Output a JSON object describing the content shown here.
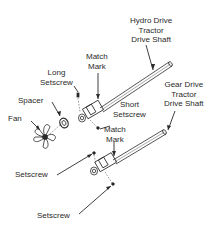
{
  "diagram": {
    "type": "exploded-parts-assembly",
    "labels": {
      "hydro_shaft": [
        "Hydro Drive",
        "Tractor",
        "Drive Shaft"
      ],
      "match_mark_top": [
        "Match",
        "Mark"
      ],
      "long_setscrew": [
        "Long",
        "Setscrew"
      ],
      "spacer": "Spacer",
      "fan": "Fan",
      "short_setscrew": [
        "Short",
        "Setscrew"
      ],
      "gear_shaft": [
        "Gear Drive",
        "Tractor",
        "Drive Shaft"
      ],
      "match_mark_bottom": [
        "Match",
        "Mark"
      ],
      "setscrew_left": "Setscrew",
      "setscrew_bottom": "Setscrew"
    },
    "parts": [
      "Fan",
      "Spacer",
      "Long Setscrew",
      "Short Setscrew",
      "Hydro Drive Tractor Drive Shaft",
      "Gear Drive Tractor Drive Shaft",
      "Setscrew",
      "Setscrew"
    ],
    "colors": {
      "line": "#2a2a2a",
      "background": "#ffffff"
    }
  }
}
